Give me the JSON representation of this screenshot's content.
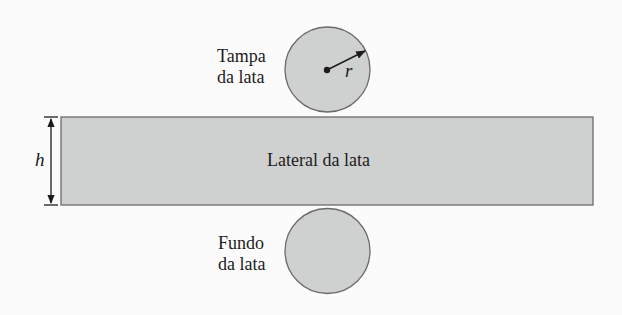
{
  "diagram": {
    "top_circle": {
      "label_line1": "Tampa",
      "label_line2": "da lata",
      "radius_label": "r"
    },
    "side_rectangle": {
      "label": "Lateral da lata",
      "height_label": "h"
    },
    "bottom_circle": {
      "label_line1": "Fundo",
      "label_line2": "da lata"
    },
    "colors": {
      "fill": "#cfd0d0",
      "stroke": "#6a6a6a",
      "background": "#fbfbfb",
      "text": "#1c1c1c"
    }
  }
}
